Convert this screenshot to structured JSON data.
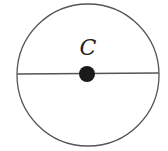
{
  "diagram": {
    "type": "circle-with-diameter",
    "center_label": "C",
    "colors": {
      "stroke": "#555555",
      "center_dot": "#1a1a1a",
      "background": "#ffffff",
      "label": "#222222"
    }
  }
}
